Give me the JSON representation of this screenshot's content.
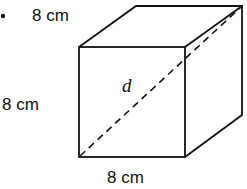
{
  "figure": {
    "bullet": "•",
    "shape": "cube",
    "labels": {
      "top_edge": "8 cm",
      "left_edge": "8 cm",
      "bottom_edge": "8 cm",
      "diagonal": "d"
    }
  }
}
